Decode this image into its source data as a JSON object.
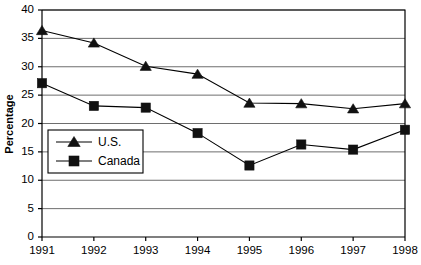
{
  "chart_data": {
    "type": "line",
    "title": "",
    "xlabel": "",
    "ylabel": "Percentage",
    "categories": [
      "1991",
      "1992",
      "1993",
      "1994",
      "1995",
      "1996",
      "1997",
      "1998"
    ],
    "x": [
      1991,
      1992,
      1993,
      1994,
      1995,
      1996,
      1997,
      1998
    ],
    "series": [
      {
        "name": "U.S.",
        "marker": "triangle",
        "color": "#111111",
        "values": [
          36.4,
          34.2,
          30.1,
          28.7,
          23.6,
          23.5,
          22.6,
          23.5
        ]
      },
      {
        "name": "Canada",
        "marker": "square",
        "color": "#111111",
        "values": [
          27.1,
          23.1,
          22.8,
          18.3,
          12.6,
          16.3,
          15.4,
          18.9
        ]
      }
    ],
    "ylim": [
      0,
      40
    ],
    "yticks": [
      0,
      5,
      10,
      15,
      20,
      25,
      30,
      35,
      40
    ],
    "ytick_labels": [
      "0",
      "5",
      "10",
      "15",
      "20",
      "25",
      "30",
      "35",
      "40"
    ],
    "grid": true,
    "grid_axis": "y",
    "legend_position": "lower-left-inside"
  },
  "legend": {
    "entries": [
      {
        "label": "U.S."
      },
      {
        "label": "Canada"
      }
    ]
  },
  "axes": {
    "y_title": "Percentage"
  }
}
